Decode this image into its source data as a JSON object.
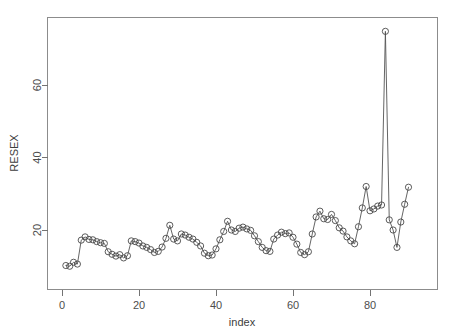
{
  "chart_data": {
    "type": "line",
    "title": "",
    "xlabel": "index",
    "ylabel": "RESEX",
    "xlim": [
      0.5,
      91
    ],
    "ylim": [
      8,
      77
    ],
    "grid": false,
    "legend": null,
    "marker": "open-circle",
    "xticks": [
      0,
      20,
      40,
      60,
      80
    ],
    "yticks": [
      20,
      40,
      60
    ],
    "xtick_labels": [
      "0",
      "20",
      "40",
      "60",
      "80"
    ],
    "ytick_labels": [
      "20",
      "40",
      "60"
    ],
    "x": [
      1,
      2,
      3,
      4,
      5,
      6,
      7,
      8,
      9,
      10,
      11,
      12,
      13,
      14,
      15,
      16,
      17,
      18,
      19,
      20,
      21,
      22,
      23,
      24,
      25,
      26,
      27,
      28,
      29,
      30,
      31,
      32,
      33,
      34,
      35,
      36,
      37,
      38,
      39,
      40,
      41,
      42,
      43,
      44,
      45,
      46,
      47,
      48,
      49,
      50,
      51,
      52,
      53,
      54,
      55,
      56,
      57,
      58,
      59,
      60,
      61,
      62,
      63,
      64,
      65,
      66,
      67,
      68,
      69,
      70,
      71,
      72,
      73,
      74,
      75,
      76,
      77,
      78,
      79,
      80,
      81,
      82,
      83,
      84,
      85,
      86,
      87,
      88,
      89,
      90
    ],
    "values": [
      10.2,
      10.0,
      11.1,
      10.6,
      17.2,
      18.1,
      17.4,
      17.3,
      16.8,
      16.5,
      16.3,
      14.0,
      13.3,
      12.8,
      13.2,
      12.3,
      12.9,
      17.0,
      16.8,
      16.4,
      15.6,
      15.2,
      14.6,
      13.8,
      14.1,
      15.3,
      17.7,
      21.3,
      17.5,
      17.0,
      18.9,
      18.6,
      18.0,
      17.5,
      16.6,
      15.6,
      13.6,
      12.9,
      13.1,
      14.8,
      17.3,
      19.6,
      22.4,
      20.0,
      19.6,
      20.5,
      20.8,
      20.3,
      19.9,
      18.4,
      16.8,
      15.2,
      14.3,
      14.1,
      17.5,
      18.6,
      19.4,
      19.0,
      19.2,
      18.0,
      16.1,
      13.8,
      13.2,
      14.0,
      18.9,
      23.6,
      25.2,
      23.1,
      22.9,
      24.3,
      22.6,
      20.6,
      19.7,
      18.1,
      17.0,
      16.2,
      20.9,
      26.1,
      32.0,
      25.3,
      25.8,
      26.6,
      26.9,
      74.8,
      22.8,
      20.0,
      15.2,
      22.2,
      27.1,
      31.8
    ]
  },
  "axis": {
    "y_title": "RESEX",
    "x_title": "index"
  }
}
